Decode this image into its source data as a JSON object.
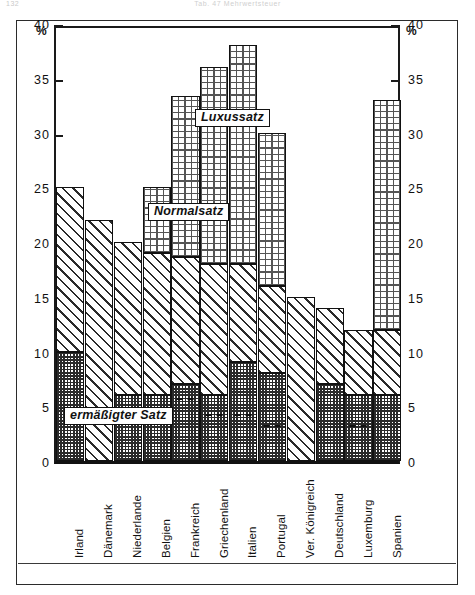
{
  "page": {
    "folio": "132",
    "running_title": "Tab. 47  Mehrwertsteuer"
  },
  "axis": {
    "unit_left": "%",
    "unit_right": "%",
    "ticks": [
      "40",
      "35",
      "30",
      "25",
      "20",
      "15",
      "10",
      "5",
      "0"
    ]
  },
  "legend": {
    "luxury": "Luxussatz",
    "standard": "Normalsatz",
    "reduced": "ermäßigter Satz"
  },
  "chart_data": {
    "type": "bar",
    "title": "Tab. 47  Mehrwertsteuer",
    "xlabel": "",
    "ylabel": "%",
    "ylim": [
      0,
      40
    ],
    "ytick_step": 5,
    "grid": false,
    "stacked": true,
    "legend_position": "in-plot labels",
    "categories": [
      "Irland",
      "Dänemark",
      "Niederlande",
      "Belgien",
      "Frankreich",
      "Griechenland",
      "Italien",
      "Portugal",
      "Ver. Königreich",
      "Deutschland",
      "Luxemburg",
      "Spanien"
    ],
    "series": [
      {
        "name": "ermäßigter Satz",
        "values": [
          10,
          null,
          6,
          6,
          7,
          6,
          9,
          8,
          null,
          7,
          6,
          6
        ]
      },
      {
        "name": "Normalsatz",
        "values": [
          25,
          22,
          20,
          19,
          18.6,
          18,
          18,
          16,
          15,
          14,
          12,
          12
        ]
      },
      {
        "name": "Luxussatz",
        "values": [
          null,
          null,
          null,
          25,
          33.3,
          36,
          38,
          30,
          null,
          null,
          null,
          33
        ]
      }
    ],
    "sub_rate_markers": {
      "note": "dashed line inside reduced segment",
      "countries": [
        "Frankreich",
        "Griechenland",
        "Italien",
        "Portugal",
        "Luxemburg"
      ],
      "values": [
        5.5,
        4,
        4,
        3,
        3
      ]
    }
  }
}
